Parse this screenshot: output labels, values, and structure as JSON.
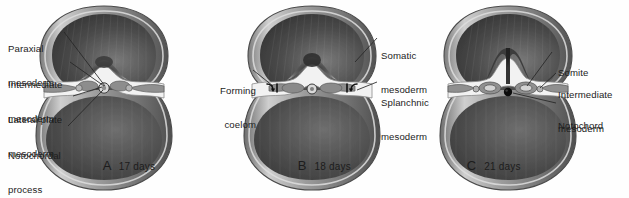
{
  "figure": {
    "type": "embryology-cross-section-series",
    "background_color": "#ffffff",
    "text_color": "#1c1c1c",
    "style": "grayscale medical illustration"
  },
  "panels": [
    {
      "id": "A",
      "caption_letter": "A",
      "caption_days": "17 days",
      "labels": [
        {
          "id": "paraxial-mesoderm",
          "line1": "Paraxial",
          "line2": "mesoderm"
        },
        {
          "id": "intermediate-mesoderm",
          "line1": "Intermediate",
          "line2": "mesoderm"
        },
        {
          "id": "lateral-plate-mesoderm",
          "line1": "Lateral plate",
          "line2": "mesoderm"
        },
        {
          "id": "notochordal-process",
          "line1": "Notochordal",
          "line2": "process"
        }
      ]
    },
    {
      "id": "B",
      "caption_letter": "B",
      "caption_days": "18 days",
      "labels": [
        {
          "id": "forming-coelom",
          "line1": "Forming",
          "line2": "coelom"
        },
        {
          "id": "somatic-mesoderm",
          "line1": "Somatic",
          "line2": "mesoderm"
        },
        {
          "id": "splanchnic-mesoderm",
          "line1": "Splanchnic",
          "line2": "mesoderm"
        }
      ]
    },
    {
      "id": "C",
      "caption_letter": "C",
      "caption_days": "21 days",
      "labels": [
        {
          "id": "somite",
          "line1": "Somite",
          "line2": ""
        },
        {
          "id": "intermediate-mesoderm",
          "line1": "Intermediate",
          "line2": "mesoderm"
        },
        {
          "id": "notochord",
          "line1": "Notochord",
          "line2": ""
        }
      ]
    }
  ],
  "colors": {
    "outer_membrane_light": "#d8d8d8",
    "outer_membrane_mid": "#9a9a9a",
    "outer_membrane_dark": "#5d5d5d",
    "cavity_dark": "#4a4a4a",
    "cavity_darkest": "#2a2a2a",
    "disc_light": "#efefef",
    "mesoderm_gray": "#8c8c8c",
    "notochord_black": "#101010",
    "leader_line": "#2a2a2a"
  }
}
